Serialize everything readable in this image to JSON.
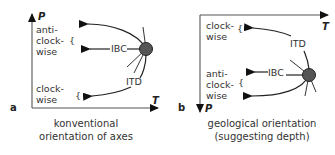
{
  "panel_a": {
    "label": "a",
    "y_axis": "P",
    "x_axis": "T",
    "upper_text": [
      "anti-",
      "clock-",
      "wise"
    ],
    "upper_brace": "{",
    "lower_text": [
      "clock-",
      "wise"
    ],
    "lower_brace": "{",
    "ibc_label": "IBC",
    "itd_label": "ITD",
    "caption": [
      "konventional",
      "orientation of axes"
    ]
  },
  "panel_b": {
    "label": "b",
    "y_axis": "P",
    "x_axis": "T",
    "upper_text": [
      "clock-",
      "wise"
    ],
    "upper_brace": "{",
    "lower_text": [
      "anti-",
      "clock-",
      "wise"
    ],
    "lower_brace": "{",
    "ibc_label": "IBC",
    "itd_label": "ITD",
    "caption": [
      "geological orientation",
      "(suggesting depth)"
    ]
  },
  "colors": {
    "node_fill": "#555555",
    "line": "#222222",
    "axis": "#555555",
    "text": "#333333"
  }
}
